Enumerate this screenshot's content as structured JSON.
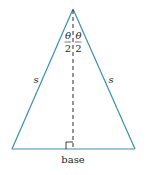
{
  "diagram": {
    "type": "isosceles-triangle",
    "colors": {
      "edge": "#3a8fb0",
      "altitude": "#2a2a2a",
      "text": "#231f20"
    },
    "apex_angle_labels": {
      "left": {
        "numerator": "θ",
        "denominator": "2"
      },
      "right": {
        "numerator": "θ",
        "denominator": "2"
      }
    },
    "side_labels": {
      "left": "s",
      "right": "s"
    },
    "base_label": "base",
    "right_angle_marker": true,
    "altitude_style": "dashed"
  }
}
